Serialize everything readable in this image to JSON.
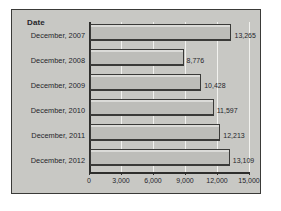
{
  "panel": {
    "background_color": "#c8c8c4",
    "border_color": "#3a3a38"
  },
  "axis_title": "Date",
  "chart_data": {
    "type": "bar",
    "orientation": "horizontal",
    "title": "",
    "subtitle": "",
    "xlabel": "",
    "ylabel": "Date",
    "categories": [
      "December, 2007",
      "December, 2008",
      "December, 2009",
      "December, 2010",
      "December, 2011",
      "December, 2012"
    ],
    "values": [
      13265,
      8776,
      10428,
      11597,
      12213,
      13109
    ],
    "value_labels": [
      "13,265",
      "8,776",
      "10,428",
      "11,597",
      "12,213",
      "13,109"
    ],
    "xlim": [
      0,
      15000
    ],
    "xticks": [
      0,
      3000,
      6000,
      9000,
      12000,
      15000
    ],
    "xtick_labels": [
      "0",
      "3,000",
      "6,000",
      "9,000",
      "12,000",
      "15,000"
    ],
    "grid": true,
    "gridline_color": "#f2f2ef",
    "legend": false,
    "bar_color": "#bdbdb9",
    "bar_edge_color": "#3a3a38"
  }
}
